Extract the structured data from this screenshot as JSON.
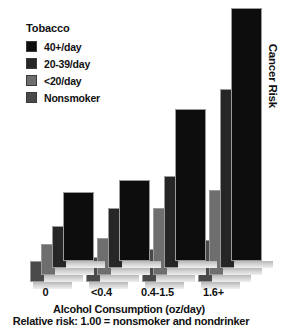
{
  "chart_data": {
    "type": "bar",
    "title": "",
    "xlabel": "Alcohol Consumption (oz/day)",
    "ylabel": "Cancer Risk",
    "footnote": "Relative risk: 1.00 = nonsmoker and nondrinker",
    "legend_title": "Tobacco",
    "legend_position": "top-left",
    "grid": false,
    "axis_ticks": false,
    "categories": [
      "0",
      "<0.4",
      "0.4-1.5",
      "1.6+"
    ],
    "series": [
      {
        "name": "Nonsmoker",
        "color": "#4a4a4a",
        "values": [
          1.0,
          1.2,
          1.6,
          2.0
        ]
      },
      {
        "name": "<20/day",
        "color": "#6e6e6e",
        "values": [
          1.5,
          1.8,
          3.2,
          4.1
        ]
      },
      {
        "name": "20-39/day",
        "color": "#262626",
        "values": [
          2.0,
          2.9,
          4.4,
          8.6
        ]
      },
      {
        "name": "40+/day",
        "color": "#0d0d0d",
        "values": [
          3.3,
          3.9,
          7.3,
          12.5
        ]
      }
    ]
  },
  "legend": {
    "title": "Tobacco",
    "items": [
      {
        "label": "40+/day",
        "color": "#0d0d0d"
      },
      {
        "label": "20-39/day",
        "color": "#262626"
      },
      {
        "label": "<20/day",
        "color": "#6e6e6e"
      },
      {
        "label": "Nonsmoker",
        "color": "#4a4a4a"
      }
    ]
  },
  "axes": {
    "x_ticks": [
      "0",
      "<0.4",
      "0.4-1.5",
      "1.6+"
    ],
    "x_title": "Alcohol Consumption (oz/day)",
    "y_title": "Cancer Risk",
    "footnote": "Relative risk: 1.00 = nonsmoker and nondrinker"
  }
}
